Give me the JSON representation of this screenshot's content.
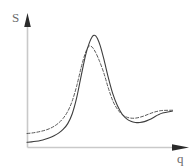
{
  "chart_data": {
    "type": "line",
    "title": "",
    "subtitle": "",
    "xlabel": "q",
    "ylabel": "S",
    "grid": false,
    "legend": null,
    "legend_position": "none",
    "axis_style": "arrow",
    "xlim": [
      0,
      1
    ],
    "ylim": [
      0,
      1
    ],
    "xticks": [],
    "yticks": [],
    "xticklabels": [],
    "yticklabels": [],
    "annotations": [],
    "series": [
      {
        "name": "solid-curve",
        "style": "solid",
        "color": "#3d3d3d",
        "linewidth": 1.1,
        "x": [
          0.0,
          0.031,
          0.062,
          0.093,
          0.124,
          0.155,
          0.186,
          0.217,
          0.248,
          0.28,
          0.311,
          0.342,
          0.373,
          0.404,
          0.429,
          0.448,
          0.46,
          0.472,
          0.484,
          0.503,
          0.528,
          0.559,
          0.59,
          0.621,
          0.652,
          0.683,
          0.714,
          0.745,
          0.776,
          0.807,
          0.839,
          0.87,
          0.901,
          0.932,
          1.0
        ],
        "y": [
          0.045,
          0.048,
          0.053,
          0.06,
          0.07,
          0.083,
          0.1,
          0.123,
          0.155,
          0.205,
          0.29,
          0.43,
          0.62,
          0.8,
          0.9,
          0.95,
          0.963,
          0.958,
          0.935,
          0.875,
          0.76,
          0.6,
          0.46,
          0.36,
          0.29,
          0.248,
          0.225,
          0.215,
          0.214,
          0.222,
          0.238,
          0.258,
          0.28,
          0.296,
          0.313
        ]
      },
      {
        "name": "dashed-curve",
        "style": "dashed",
        "color": "#595959",
        "linewidth": 1.0,
        "dash_pattern": "3 2",
        "x": [
          0.0,
          0.031,
          0.062,
          0.093,
          0.124,
          0.155,
          0.186,
          0.217,
          0.248,
          0.28,
          0.311,
          0.342,
          0.373,
          0.398,
          0.417,
          0.429,
          0.441,
          0.453,
          0.472,
          0.497,
          0.528,
          0.559,
          0.59,
          0.621,
          0.652,
          0.683,
          0.714,
          0.745,
          0.776,
          0.807,
          0.839,
          0.87,
          0.901,
          0.932,
          1.0
        ],
        "y": [
          0.12,
          0.124,
          0.13,
          0.138,
          0.148,
          0.162,
          0.182,
          0.21,
          0.25,
          0.31,
          0.4,
          0.53,
          0.69,
          0.8,
          0.855,
          0.872,
          0.868,
          0.855,
          0.815,
          0.745,
          0.64,
          0.51,
          0.4,
          0.33,
          0.285,
          0.262,
          0.252,
          0.252,
          0.26,
          0.272,
          0.288,
          0.302,
          0.312,
          0.318,
          0.32
        ]
      }
    ],
    "axes": {
      "x_axis_color": "#c9c9c9",
      "y_axis_color": "#c9c9c9",
      "arrow_color": "#2b2b2b",
      "label_color": "#6b6b6b"
    }
  }
}
